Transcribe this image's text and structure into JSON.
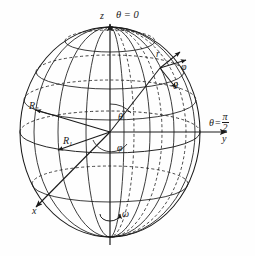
{
  "figure": {
    "type": "geometry-diagram",
    "background_color": "#fefefe",
    "stroke_color": "#1a1a1a",
    "labels": {
      "z_axis": "z",
      "y_axis": "y",
      "x_axis": "x",
      "theta_zero": "θ = 0",
      "theta_pi_over_two_symbol": "θ",
      "theta_pi_over_two_equals": "=",
      "theta_pi_over_two_num": "π",
      "theta_pi_over_two_den": "2",
      "unit_vector_r": "r",
      "unit_vector_phi": "φ",
      "unit_vector_theta": "θ",
      "angle_theta": "θ",
      "angle_phi": "φ",
      "vector_R1_base": "R",
      "vector_R1_sub": "1",
      "vector_R2_base": "R",
      "vector_R2_sub": "2",
      "rotation_omega": "ω"
    },
    "sphere": {
      "center_x": 110,
      "center_y": 132,
      "radius_x": 90,
      "radius_y": 105
    },
    "grid": {
      "latitude_count": 5,
      "longitude_count": 7,
      "dashed_hidden_lines": true
    }
  }
}
